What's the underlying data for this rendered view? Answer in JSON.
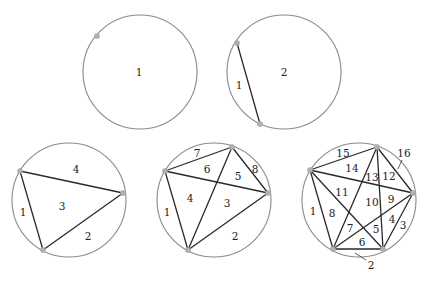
{
  "diagram": {
    "colors": {
      "circle": "#8a8a8a",
      "chord": "#2a2a2a",
      "point": "#b0b0b0",
      "label": "#222222"
    },
    "panels": [
      {
        "id": "n1",
        "points_count": 1,
        "regions_count": 1,
        "circle": {
          "cx": 140,
          "cy": 72,
          "r": 57
        },
        "points": [
          [
            97,
            36
          ]
        ],
        "chords": [],
        "labels": [
          {
            "text": "1",
            "x": 139,
            "y": 72
          }
        ],
        "leaders": []
      },
      {
        "id": "n2",
        "points_count": 2,
        "regions_count": 2,
        "circle": {
          "cx": 284,
          "cy": 72,
          "r": 57
        },
        "points": [
          [
            237,
            43
          ],
          [
            260,
            124
          ]
        ],
        "chords": [
          [
            0,
            1
          ]
        ],
        "labels": [
          {
            "text": "1",
            "x": 239,
            "y": 85
          },
          {
            "text": "2",
            "x": 284,
            "y": 72
          }
        ],
        "leaders": []
      },
      {
        "id": "n3",
        "points_count": 3,
        "regions_count": 4,
        "circle": {
          "cx": 69,
          "cy": 200,
          "r": 57
        },
        "points": [
          [
            20,
            171
          ],
          [
            123,
            193
          ],
          [
            43,
            250
          ]
        ],
        "chords": [
          [
            0,
            1
          ],
          [
            1,
            2
          ],
          [
            2,
            0
          ]
        ],
        "labels": [
          {
            "text": "1",
            "x": 23,
            "y": 212
          },
          {
            "text": "2",
            "x": 88,
            "y": 236
          },
          {
            "text": "3",
            "x": 62,
            "y": 206
          },
          {
            "text": "4",
            "x": 76,
            "y": 169
          }
        ],
        "leaders": []
      },
      {
        "id": "n4",
        "points_count": 4,
        "regions_count": 8,
        "circle": {
          "cx": 214,
          "cy": 200,
          "r": 57
        },
        "points": [
          [
            165,
            171
          ],
          [
            232,
            147
          ],
          [
            268,
            193
          ],
          [
            188,
            250
          ]
        ],
        "chords": [
          [
            0,
            1
          ],
          [
            0,
            2
          ],
          [
            0,
            3
          ],
          [
            1,
            2
          ],
          [
            1,
            3
          ],
          [
            2,
            3
          ]
        ],
        "labels": [
          {
            "text": "1",
            "x": 167,
            "y": 212
          },
          {
            "text": "2",
            "x": 235,
            "y": 236
          },
          {
            "text": "3",
            "x": 227,
            "y": 203
          },
          {
            "text": "4",
            "x": 190,
            "y": 198
          },
          {
            "text": "5",
            "x": 238,
            "y": 176
          },
          {
            "text": "6",
            "x": 207,
            "y": 169
          },
          {
            "text": "7",
            "x": 197,
            "y": 153
          },
          {
            "text": "8",
            "x": 255,
            "y": 169
          }
        ],
        "leaders": []
      },
      {
        "id": "n5",
        "points_count": 5,
        "regions_count": 16,
        "circle": {
          "cx": 359,
          "cy": 200,
          "r": 57
        },
        "points": [
          [
            310,
            170
          ],
          [
            377,
            147
          ],
          [
            413,
            193
          ],
          [
            383,
            249
          ],
          [
            333,
            249
          ]
        ],
        "chords": [
          [
            0,
            1
          ],
          [
            0,
            2
          ],
          [
            0,
            3
          ],
          [
            0,
            4
          ],
          [
            1,
            2
          ],
          [
            1,
            3
          ],
          [
            1,
            4
          ],
          [
            2,
            3
          ],
          [
            2,
            4
          ],
          [
            3,
            4
          ]
        ],
        "labels": [
          {
            "text": "1",
            "x": 313,
            "y": 211
          },
          {
            "text": "2",
            "x": 371,
            "y": 265
          },
          {
            "text": "3",
            "x": 403,
            "y": 225
          },
          {
            "text": "4",
            "x": 392,
            "y": 219
          },
          {
            "text": "5",
            "x": 376,
            "y": 229
          },
          {
            "text": "6",
            "x": 362,
            "y": 242
          },
          {
            "text": "7",
            "x": 350,
            "y": 228
          },
          {
            "text": "8",
            "x": 332,
            "y": 213
          },
          {
            "text": "9",
            "x": 391,
            "y": 199
          },
          {
            "text": "10",
            "x": 372,
            "y": 202
          },
          {
            "text": "11",
            "x": 342,
            "y": 192
          },
          {
            "text": "12",
            "x": 389,
            "y": 176
          },
          {
            "text": "13",
            "x": 372,
            "y": 177
          },
          {
            "text": "14",
            "x": 352,
            "y": 168
          },
          {
            "text": "15",
            "x": 343,
            "y": 153
          },
          {
            "text": "16",
            "x": 404,
            "y": 153
          }
        ],
        "leaders": [
          {
            "for": "16",
            "x1": 402,
            "y1": 160,
            "x2": 398,
            "y2": 169
          },
          {
            "for": "2",
            "x1": 366,
            "y1": 260,
            "x2": 355,
            "y2": 253
          }
        ]
      }
    ]
  }
}
